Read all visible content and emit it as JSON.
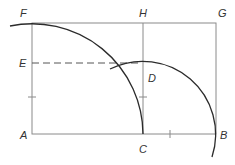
{
  "diagram": {
    "colors": {
      "frame": "#8a8a8a",
      "arc": "#2b2b2b",
      "dash": "#555555",
      "label": "#333333"
    },
    "points": {
      "A": {
        "label": "A",
        "x": 32,
        "y": 134
      },
      "B": {
        "label": "B",
        "x": 216,
        "y": 134
      },
      "C": {
        "label": "C",
        "x": 143,
        "y": 134
      },
      "D": {
        "label": "D",
        "x": 143,
        "y": 61
      },
      "E": {
        "label": "E",
        "x": 32,
        "y": 63
      },
      "F": {
        "label": "F",
        "x": 32,
        "y": 23
      },
      "G": {
        "label": "G",
        "x": 216,
        "y": 23
      },
      "H": {
        "label": "H",
        "x": 143,
        "y": 23
      }
    },
    "labels": {
      "A": "A",
      "B": "B",
      "C": "C",
      "D": "D",
      "E": "E",
      "F": "F",
      "G": "G",
      "H": "H"
    }
  }
}
